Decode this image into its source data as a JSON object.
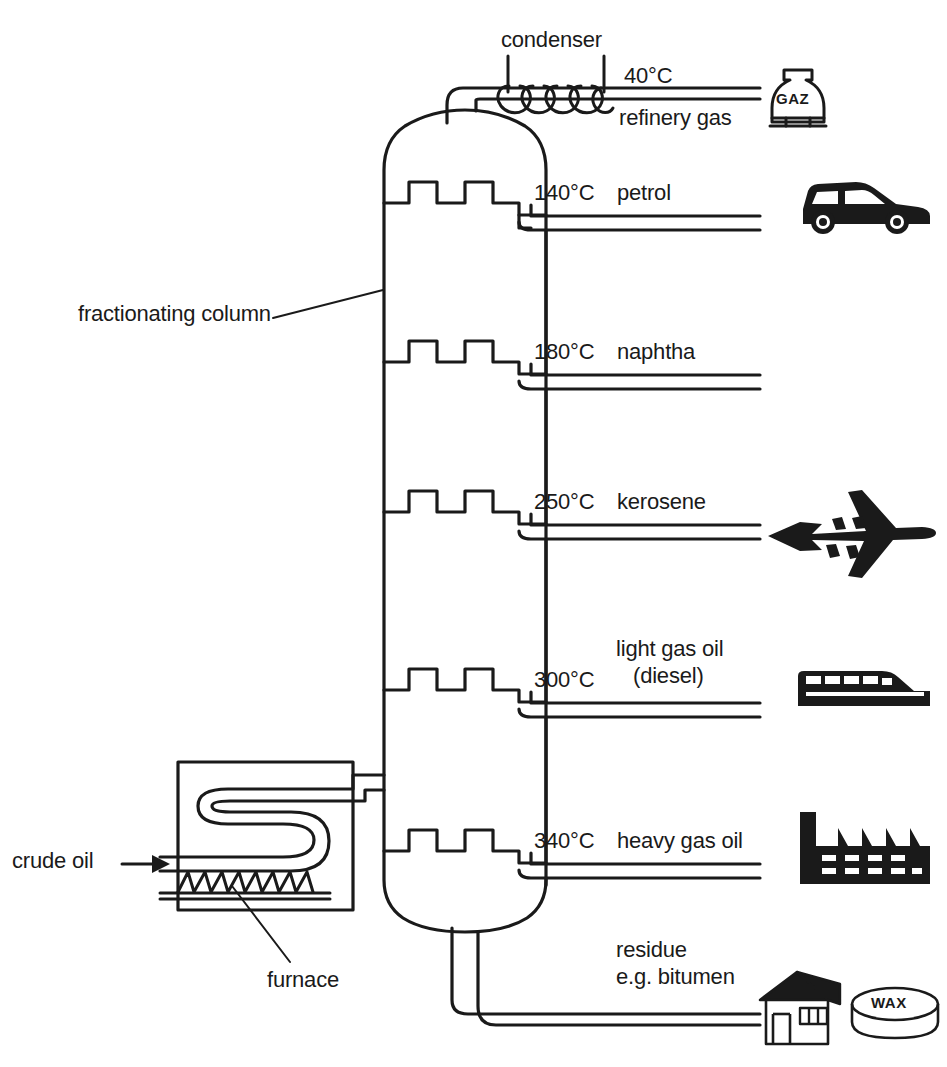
{
  "diagram": {
    "type": "process-flow-diagram",
    "background_color": "#ffffff",
    "line_color": "#1a1a1a",
    "icon_color": "#1a1a1a"
  },
  "labels": {
    "condenser": "condenser",
    "fractionating_column": "fractionating column",
    "crude_oil": "crude oil",
    "furnace": "furnace"
  },
  "fractions": [
    {
      "temperature": "40°C",
      "name": "refinery gas",
      "name_line2": "",
      "icon": "gas-bottle-icon",
      "icon_label": "GAZ"
    },
    {
      "temperature": "140°C",
      "name": "petrol",
      "name_line2": "",
      "icon": "car-icon",
      "icon_label": ""
    },
    {
      "temperature": "180°C",
      "name": "naphtha",
      "name_line2": "",
      "icon": "",
      "icon_label": ""
    },
    {
      "temperature": "250°C",
      "name": "kerosene",
      "name_line2": "",
      "icon": "airplane-icon",
      "icon_label": ""
    },
    {
      "temperature": "300°C",
      "name": "light gas oil",
      "name_line2": "(diesel)",
      "icon": "train-icon",
      "icon_label": ""
    },
    {
      "temperature": "340°C",
      "name": "heavy gas oil",
      "name_line2": "",
      "icon": "factory-icon",
      "icon_label": ""
    },
    {
      "temperature": "",
      "name": "residue",
      "name_line2": "e.g. bitumen",
      "icon": "house-icon",
      "icon_label": "WAX"
    }
  ],
  "icons": {
    "gas_bottle_text": "GAZ",
    "wax_text": "WAX"
  }
}
